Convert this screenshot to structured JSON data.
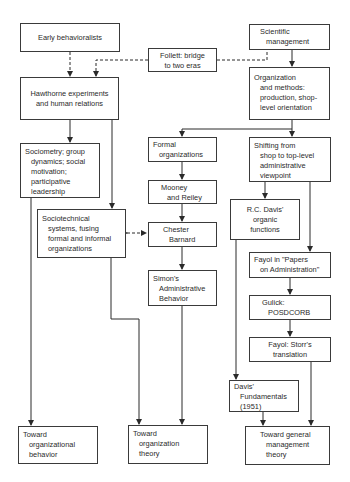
{
  "diagram": {
    "nodes": {
      "early": [
        "Early behavioralists"
      ],
      "follett": [
        "Follett: bridge",
        "to two eras"
      ],
      "scientific": [
        "Scientific",
        "management"
      ],
      "hawthorne": [
        "Hawthorne experiments",
        "and human relations"
      ],
      "orgmethods": [
        "Organization",
        "and methods:",
        "production, shop-",
        "level orientation"
      ],
      "sociometry": [
        "Sociometry; group",
        "dynamics; social",
        "motivation;",
        "participative",
        "leadership"
      ],
      "formal": [
        "Formal",
        "organizations"
      ],
      "shifting": [
        "Shifting from",
        "shop to top-level",
        "administrative",
        "viewpoint"
      ],
      "mooney": [
        "Mooney",
        "and Reiley"
      ],
      "sociotech": [
        "Sociotechnical",
        "systems, fusing",
        "formal and informal",
        "organizations"
      ],
      "barnard": [
        "Chester",
        "Barnard"
      ],
      "rcdavis": [
        "R.C. Davis'",
        "organic",
        "functions"
      ],
      "simon": [
        "Simon's",
        "Administrative",
        "Behavior"
      ],
      "fayolpapers": [
        "Fayol in \"Papers",
        "on Administration\""
      ],
      "gulick": [
        "Gulick:",
        "POSDCORB"
      ],
      "fayolstorr": [
        "Fayol: Storr's",
        "translation"
      ],
      "davisfund": [
        "Davis'",
        "Fundamentals",
        "(1951)"
      ],
      "towardob": [
        "Toward",
        "organizational",
        "behavior"
      ],
      "towardot": [
        "Toward",
        "organization",
        "theory"
      ],
      "towardgm": [
        "Toward general",
        "management",
        "theory"
      ]
    },
    "edges": [
      {
        "from": "early",
        "to": "hawthorne",
        "style": "dashed"
      },
      {
        "from": "follett",
        "to": "hawthorne",
        "style": "dashed"
      },
      {
        "from": "follett",
        "to": "scientific",
        "style": "dashed"
      },
      {
        "from": "scientific",
        "to": "orgmethods",
        "style": "solid"
      },
      {
        "from": "hawthorne",
        "to": "sociometry",
        "style": "solid"
      },
      {
        "from": "hawthorne",
        "to": "sociotech",
        "style": "solid"
      },
      {
        "from": "orgmethods",
        "to": "formal",
        "style": "solid"
      },
      {
        "from": "orgmethods",
        "to": "shifting",
        "style": "solid"
      },
      {
        "from": "formal",
        "to": "mooney",
        "style": "solid"
      },
      {
        "from": "mooney",
        "to": "barnard",
        "style": "solid"
      },
      {
        "from": "sociotech",
        "to": "barnard",
        "style": "dashed-bidirectional"
      },
      {
        "from": "barnard",
        "to": "simon",
        "style": "solid"
      },
      {
        "from": "shifting",
        "to": "rcdavis",
        "style": "solid"
      },
      {
        "from": "shifting",
        "to": "fayolpapers",
        "style": "solid"
      },
      {
        "from": "fayolpapers",
        "to": "gulick",
        "style": "solid"
      },
      {
        "from": "gulick",
        "to": "fayolstorr",
        "style": "solid"
      },
      {
        "from": "rcdavis",
        "to": "davisfund",
        "style": "solid"
      },
      {
        "from": "fayolstorr",
        "to": "towardgm",
        "style": "solid"
      },
      {
        "from": "davisfund",
        "to": "towardgm",
        "style": "solid"
      },
      {
        "from": "sociometry",
        "to": "towardob",
        "style": "solid"
      },
      {
        "from": "sociotech",
        "to": "towardot",
        "style": "solid"
      },
      {
        "from": "simon",
        "to": "towardot",
        "style": "solid"
      }
    ]
  }
}
